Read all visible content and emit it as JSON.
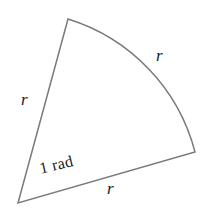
{
  "figure": {
    "name": "circular-sector-radian-diagram",
    "background_color": "#ffffff",
    "stroke_color": "#7a7a7a",
    "stroke_width": 1.5,
    "text_color": "#1a1a1a",
    "labels": {
      "radius_left": "r",
      "radius_arc": "r",
      "radius_base": "r",
      "angle": "1 rad"
    }
  },
  "chart_data": {
    "type": "diagram",
    "title": "",
    "shape": "circular sector",
    "center": [
      18,
      203
    ],
    "radius": 189,
    "central_angle_rad": 1,
    "vertices": {
      "center": [
        18,
        203
      ],
      "arc_start_top": [
        68,
        19
      ],
      "arc_end_right": [
        195,
        152
      ]
    },
    "edges": [
      {
        "name": "radius-left",
        "from": [
          18,
          203
        ],
        "to": [
          68,
          19
        ],
        "label": "r"
      },
      {
        "name": "arc",
        "from": [
          68,
          19
        ],
        "to": [
          195,
          152
        ],
        "label": "r",
        "curved": true
      },
      {
        "name": "radius-base",
        "from": [
          195,
          152
        ],
        "to": [
          18,
          203
        ],
        "label": "r"
      }
    ],
    "annotations": [
      {
        "text": "r",
        "position": [
          27,
          100
        ],
        "style": "italic"
      },
      {
        "text": "r",
        "position": [
          162,
          56
        ],
        "style": "italic"
      },
      {
        "text": "r",
        "position": [
          113,
          189
        ],
        "style": "italic"
      },
      {
        "text": "1 rad",
        "position": [
          38,
          161
        ],
        "rotation_deg": -13.5,
        "style": "normal"
      }
    ],
    "path_d": "M 18 203 L 68 19 A 189 189 0 0 1 195 152 Z"
  }
}
